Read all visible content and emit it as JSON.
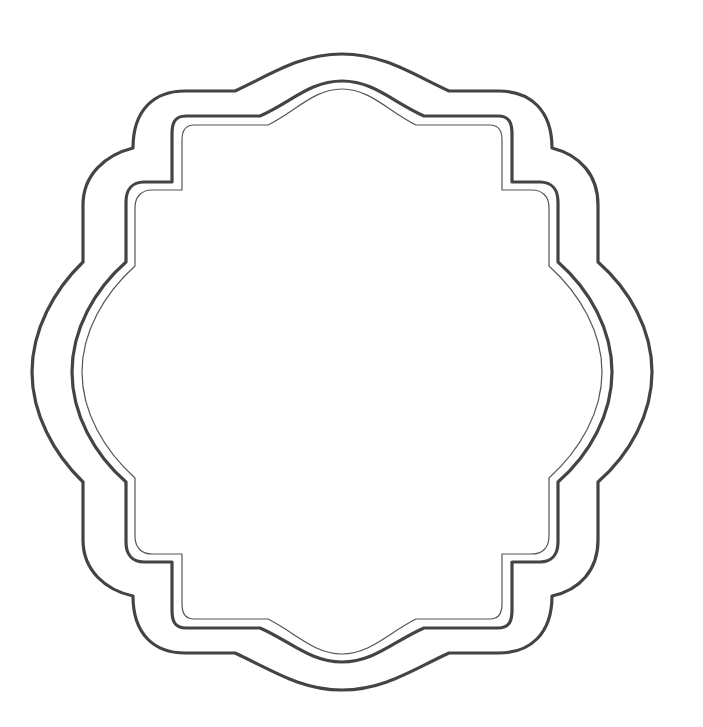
{
  "image": {
    "title": "Decorative scalloped frame",
    "description": "Blank ornamental label frame with three nested scalloped outlines",
    "background": "#ffffff",
    "stroke_color": "#444444",
    "width": 703,
    "height": 727
  },
  "frame": {
    "center": [
      342,
      372
    ],
    "outlines": [
      {
        "name": "outer",
        "stroke_width": 3.2,
        "color": "#444444"
      },
      {
        "name": "middle",
        "stroke_width": 3.2,
        "color": "#444444"
      },
      {
        "name": "inner-thin",
        "stroke_width": 1.2,
        "color": "#555555"
      }
    ]
  }
}
